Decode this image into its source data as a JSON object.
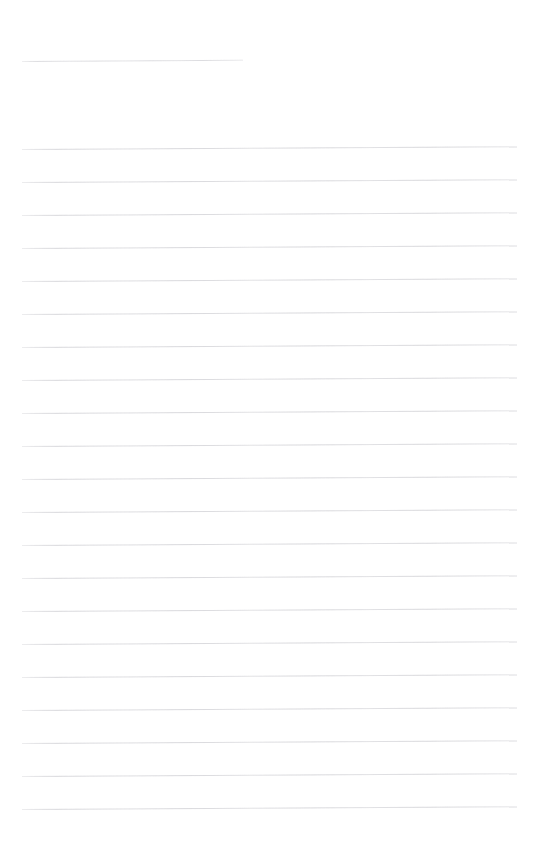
{
  "page": {
    "width": 538,
    "height": 851,
    "background_color": "#ffffff",
    "content_text": ""
  },
  "rules": {
    "line_color": "#d6d6da",
    "line_thickness_px": 1,
    "line_spacing_px": 33,
    "tilt_degrees": -0.33,
    "left_margin_px": 22,
    "right_edge_px": 517,
    "full_line_count": 21,
    "short_line_count": 1,
    "total_line_count": 22,
    "items": [
      {
        "index": 0,
        "y": 61,
        "x_start": 22,
        "x_end": 243,
        "kind": "short"
      },
      {
        "index": 1,
        "y": 149,
        "x_start": 22,
        "x_end": 517,
        "kind": "full"
      },
      {
        "index": 2,
        "y": 182,
        "x_start": 22,
        "x_end": 517,
        "kind": "full"
      },
      {
        "index": 3,
        "y": 215,
        "x_start": 22,
        "x_end": 517,
        "kind": "full"
      },
      {
        "index": 4,
        "y": 248,
        "x_start": 22,
        "x_end": 517,
        "kind": "full"
      },
      {
        "index": 5,
        "y": 281,
        "x_start": 22,
        "x_end": 517,
        "kind": "full"
      },
      {
        "index": 6,
        "y": 314,
        "x_start": 22,
        "x_end": 517,
        "kind": "full"
      },
      {
        "index": 7,
        "y": 347,
        "x_start": 22,
        "x_end": 517,
        "kind": "full"
      },
      {
        "index": 8,
        "y": 380,
        "x_start": 22,
        "x_end": 517,
        "kind": "full"
      },
      {
        "index": 9,
        "y": 413,
        "x_start": 22,
        "x_end": 517,
        "kind": "full"
      },
      {
        "index": 10,
        "y": 446,
        "x_start": 22,
        "x_end": 517,
        "kind": "full"
      },
      {
        "index": 11,
        "y": 479,
        "x_start": 22,
        "x_end": 517,
        "kind": "full"
      },
      {
        "index": 12,
        "y": 512,
        "x_start": 22,
        "x_end": 517,
        "kind": "full"
      },
      {
        "index": 13,
        "y": 545,
        "x_start": 22,
        "x_end": 517,
        "kind": "full"
      },
      {
        "index": 14,
        "y": 578,
        "x_start": 22,
        "x_end": 517,
        "kind": "full"
      },
      {
        "index": 15,
        "y": 611,
        "x_start": 22,
        "x_end": 517,
        "kind": "full"
      },
      {
        "index": 16,
        "y": 644,
        "x_start": 22,
        "x_end": 517,
        "kind": "full"
      },
      {
        "index": 17,
        "y": 677,
        "x_start": 22,
        "x_end": 517,
        "kind": "full"
      },
      {
        "index": 18,
        "y": 710,
        "x_start": 22,
        "x_end": 517,
        "kind": "full"
      },
      {
        "index": 19,
        "y": 743,
        "x_start": 22,
        "x_end": 517,
        "kind": "full"
      },
      {
        "index": 20,
        "y": 776,
        "x_start": 22,
        "x_end": 517,
        "kind": "full"
      },
      {
        "index": 21,
        "y": 809,
        "x_start": 22,
        "x_end": 517,
        "kind": "full"
      }
    ]
  }
}
